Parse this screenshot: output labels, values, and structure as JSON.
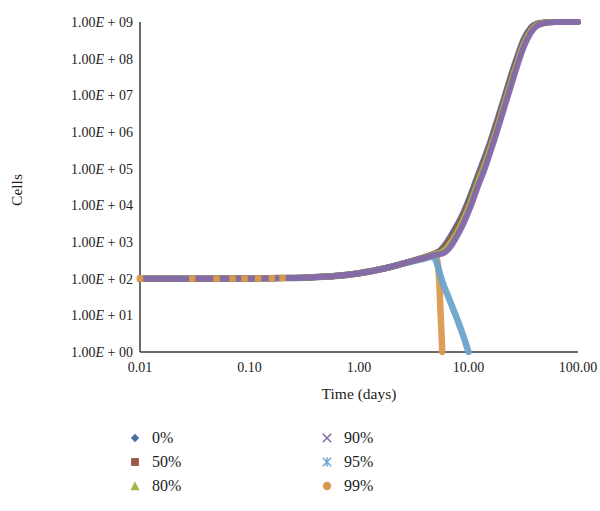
{
  "chart_data": {
    "type": "line",
    "title": "",
    "xlabel": "Time (days)",
    "ylabel": "Cells",
    "xscale": "log",
    "yscale": "log",
    "xlim": [
      0.01,
      100.0
    ],
    "ylim": [
      1.0,
      1000000000.0
    ],
    "grid": false,
    "legend_position": "bottom",
    "x_tick_labels": [
      "0.01",
      "0.10",
      "1.00",
      "10.00",
      "100.00"
    ],
    "x_tick_values": [
      0.01,
      0.1,
      1.0,
      10.0,
      100.0
    ],
    "y_tick_labels": [
      "1.00E + 09",
      "1.00E + 08",
      "1.00E + 07",
      "1.00E + 06",
      "1.00E + 05",
      "1.00E + 04",
      "1.00E + 03",
      "1.00E + 02",
      "1.00E + 01",
      "1.00E + 00"
    ],
    "y_tick_values": [
      1000000000.0,
      100000000.0,
      10000000.0,
      1000000.0,
      100000.0,
      10000.0,
      1000.0,
      100.0,
      10.0,
      1.0
    ],
    "series": [
      {
        "name": "0%",
        "color": "#4a6fa5",
        "marker": "diamond",
        "x": [
          0.01,
          0.03,
          0.07,
          0.12,
          0.2,
          0.35,
          0.6,
          1.0,
          1.7,
          2.6,
          3.6,
          4.6,
          5.2,
          5.6,
          6.2,
          7.0,
          8.0,
          9.0,
          10.5,
          12.0,
          14.0,
          16.0,
          18.5,
          21.0,
          24.0,
          28.0,
          32.0,
          37.0,
          42.0,
          50.0,
          62.0,
          78.0,
          100.0
        ],
        "y": [
          100,
          100,
          101,
          102,
          104,
          108,
          118,
          140,
          190,
          265,
          350,
          450,
          530,
          620,
          900,
          1600,
          3200,
          6500,
          20000,
          60000,
          200000,
          620000,
          2400000,
          8000000,
          30000000,
          120000000,
          350000000,
          700000000,
          900000000,
          980000000,
          1000000000,
          1000000000,
          1000000000
        ]
      },
      {
        "name": "50%",
        "color": "#9e5644",
        "marker": "square",
        "x": [
          0.01,
          0.03,
          0.07,
          0.12,
          0.2,
          0.35,
          0.6,
          1.0,
          1.7,
          2.6,
          3.6,
          4.6,
          5.2,
          5.6,
          6.2,
          7.0,
          8.0,
          9.0,
          10.5,
          12.0,
          14.0,
          16.0,
          18.5,
          21.0,
          24.0,
          28.0,
          32.0,
          37.0,
          42.0,
          50.0,
          62.0,
          78.0,
          100.0
        ],
        "y": [
          100,
          100,
          101,
          102,
          104,
          108,
          118,
          140,
          190,
          265,
          350,
          450,
          520,
          580,
          800,
          1350,
          2700,
          5400,
          16000,
          48000,
          160000,
          500000,
          1900000,
          6500000,
          24000000,
          100000000,
          300000000,
          640000000,
          870000000,
          970000000,
          1000000000,
          1000000000,
          1000000000
        ]
      },
      {
        "name": "80%",
        "color": "#a8b84a",
        "marker": "triangle",
        "x": [
          0.01,
          0.03,
          0.07,
          0.12,
          0.2,
          0.35,
          0.6,
          1.0,
          1.7,
          2.6,
          3.6,
          4.6,
          5.2,
          5.6,
          6.2,
          7.0,
          8.0,
          9.0,
          10.5,
          12.0,
          14.0,
          16.0,
          18.5,
          21.0,
          24.0,
          28.0,
          32.0,
          37.0,
          42.0,
          50.0,
          62.0,
          78.0,
          100.0
        ],
        "y": [
          100,
          100,
          101,
          102,
          104,
          108,
          118,
          140,
          190,
          265,
          350,
          440,
          490,
          520,
          650,
          1050,
          2050,
          4200,
          12500,
          38000,
          125000,
          400000,
          1500000,
          5200000,
          19000000,
          82000000,
          255000000,
          570000000,
          830000000,
          960000000,
          1000000000,
          1000000000,
          1000000000
        ]
      },
      {
        "name": "90%",
        "color": "#8468ab",
        "marker": "cross",
        "x": [
          0.01,
          0.03,
          0.07,
          0.12,
          0.2,
          0.35,
          0.6,
          1.0,
          1.7,
          2.6,
          3.6,
          4.6,
          5.2,
          5.6,
          6.2,
          7.0,
          8.0,
          9.0,
          10.5,
          12.0,
          14.0,
          16.0,
          18.5,
          21.0,
          24.0,
          28.0,
          32.0,
          37.0,
          42.0,
          50.0,
          62.0,
          78.0,
          100.0
        ],
        "y": [
          100,
          100,
          101,
          102,
          104,
          108,
          118,
          140,
          190,
          265,
          345,
          420,
          455,
          470,
          540,
          820,
          1600,
          3200,
          9500,
          29000,
          95000,
          310000,
          1200000,
          4100000,
          15000000,
          66000000,
          210000000,
          500000000,
          780000000,
          940000000,
          1000000000,
          1000000000,
          1000000000
        ]
      },
      {
        "name": "95%",
        "color": "#6da3cc",
        "marker": "asterisk",
        "x": [
          0.01,
          0.03,
          0.07,
          0.12,
          0.2,
          0.35,
          0.6,
          1.0,
          1.7,
          2.6,
          3.6,
          4.6,
          5.0,
          5.3,
          5.6,
          6.0,
          6.6,
          7.3,
          8.0,
          8.8,
          9.4,
          9.8,
          10.0
        ],
        "y": [
          100,
          100,
          101,
          102,
          104,
          108,
          118,
          140,
          190,
          260,
          330,
          390,
          330,
          200,
          110,
          60,
          30,
          14,
          7.0,
          3.2,
          1.8,
          1.2,
          1.0
        ]
      },
      {
        "name": "99%",
        "color": "#d99a4e",
        "marker": "circle",
        "x": [
          0.01,
          0.03,
          0.05,
          0.07,
          0.09,
          0.12,
          0.16,
          0.2,
          0.26,
          0.35,
          0.45,
          0.6,
          0.8,
          1.0,
          1.3,
          1.7,
          2.2,
          2.6,
          3.1,
          3.6,
          4.1,
          4.6,
          5.0,
          5.2,
          5.4,
          5.5,
          5.6,
          5.7,
          5.75
        ],
        "y": [
          100,
          100,
          100,
          101,
          101,
          102,
          103,
          104,
          106,
          108,
          112,
          118,
          128,
          140,
          162,
          190,
          232,
          265,
          305,
          350,
          398,
          440,
          430,
          300,
          90,
          25,
          7,
          2.2,
          1.0
        ]
      }
    ]
  },
  "legend": {
    "entries": [
      {
        "label": "0%",
        "color": "#4a6fa5",
        "marker": "diamond"
      },
      {
        "label": "50%",
        "color": "#9e5644",
        "marker": "square"
      },
      {
        "label": "80%",
        "color": "#a8b84a",
        "marker": "triangle"
      },
      {
        "label": "90%",
        "color": "#8468ab",
        "marker": "cross"
      },
      {
        "label": "95%",
        "color": "#6da3cc",
        "marker": "asterisk"
      },
      {
        "label": "99%",
        "color": "#d99a4e",
        "marker": "circle"
      }
    ]
  },
  "colors": {
    "axis": "#3a3a3a",
    "text": "#1d1d1d",
    "background": "#ffffff"
  }
}
